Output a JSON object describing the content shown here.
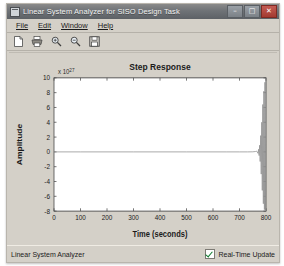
{
  "window": {
    "title": "Linear System Analyzer for SISO Design Task",
    "icon": "window-icon",
    "controls": [
      {
        "name": "minimize",
        "glyph": "–"
      },
      {
        "name": "maximize",
        "glyph": "□"
      },
      {
        "name": "close",
        "glyph": "✕"
      }
    ]
  },
  "menu": {
    "items": [
      {
        "label": "File",
        "mnemonic": "F"
      },
      {
        "label": "Edit",
        "mnemonic": "E"
      },
      {
        "label": "Window",
        "mnemonic": "W"
      },
      {
        "label": "Help",
        "mnemonic": "H"
      }
    ]
  },
  "toolbar": {
    "buttons": [
      {
        "name": "new-figure-icon",
        "tooltip": "New"
      },
      {
        "name": "print-icon",
        "tooltip": "Print"
      },
      {
        "name": "zoom-in-icon",
        "tooltip": "Zoom In"
      },
      {
        "name": "zoom-out-icon",
        "tooltip": "Zoom Out"
      },
      {
        "name": "save-icon",
        "tooltip": "Save"
      }
    ]
  },
  "status": {
    "text": "Linear System Analyzer",
    "realtime_label": "Real-Time Update",
    "realtime_checked": true
  },
  "colors": {
    "window_face": "#d4d0c8",
    "titlebar": "#6f7377",
    "close_button": "#a33a31",
    "plot_background": "#ffffff",
    "axis": "#3a3a3a",
    "trace": "#8a8a8a",
    "check": "#0d7a2e"
  },
  "chart_data": {
    "type": "line",
    "title": "Step Response",
    "xlabel": "Time (seconds)",
    "ylabel": "Amplitude",
    "y_exponent_label": "x 10",
    "y_exponent_power": "27",
    "xlim": [
      0,
      800
    ],
    "ylim": [
      -8,
      10
    ],
    "xticks": [
      0,
      100,
      200,
      300,
      400,
      500,
      600,
      700,
      800
    ],
    "yticks": [
      10,
      8,
      6,
      4,
      2,
      0,
      -2,
      -4,
      -6,
      -8
    ],
    "grid": false,
    "legend": false,
    "series": [
      {
        "name": "Step response",
        "description": "Flat near zero then unstable divergent oscillation near t=780",
        "x": [
          0,
          100,
          200,
          300,
          400,
          500,
          600,
          650,
          700,
          730,
          750,
          760,
          765,
          770,
          772,
          774,
          776,
          778,
          780,
          782,
          784,
          786,
          788,
          790,
          792,
          794,
          796,
          798,
          800
        ],
        "y": [
          0,
          0,
          0,
          0,
          0,
          0,
          0,
          0,
          0,
          0,
          0.01,
          0.05,
          0.1,
          -0.2,
          0.35,
          -0.5,
          0.9,
          -1.3,
          2.2,
          -3.0,
          4.0,
          -5.2,
          6.4,
          -7.0,
          8.2,
          -7.8,
          9.4,
          -8.0,
          10.0
        ]
      }
    ]
  }
}
